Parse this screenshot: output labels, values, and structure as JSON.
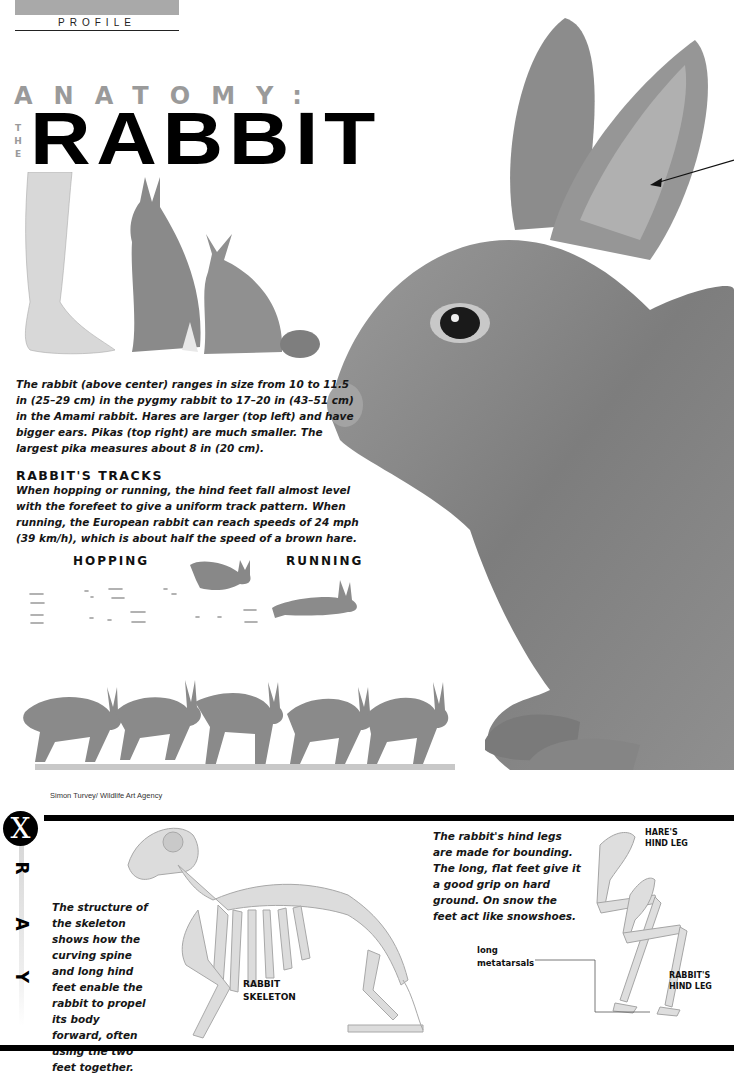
{
  "header": {
    "section_label": "PROFILE"
  },
  "title": {
    "kicker": "ANATOMY:",
    "the_vertical": [
      "T",
      "H",
      "E"
    ],
    "main": "RABBIT"
  },
  "size_caption": "The rabbit (above center) ranges in size from 10 to 11.5 in (25–29 cm) in the pygmy rabbit to 17–20 in (43–51 cm) in the Amami rabbit. Hares are larger (top left) and have bigger ears. Pikas (top right) are much smaller. The largest pika measures about 8 in (20 cm).",
  "tracks": {
    "heading": "RABBIT'S TRACKS",
    "body": "When hopping or running, the hind feet fall almost level with the forefeet to give a uniform track pattern. When running, the European rabbit can reach speeds of 24 mph (39 km/h), which is about half the speed of a brown hare.",
    "hopping_label": "HOPPING",
    "running_label": "RUNNING"
  },
  "credit": "Simon Turvey/ Wildlife Art Agency",
  "xray": {
    "badge": "X",
    "letters": [
      "R",
      "A",
      "Y"
    ],
    "skeleton_text": "The structure of the skeleton shows how the curving spine and long hind feet enable the rabbit to propel its body forward, often using the two feet together.",
    "skeleton_label_line1": "RABBIT",
    "skeleton_label_line2": "SKELETON",
    "hind_legs_text": "The rabbit's hind legs are made for bounding. The long, flat feet give it a good grip on hard ground. On snow the feet act like snowshoes.",
    "hare_label_line1": "HARE'S",
    "hare_label_line2": "HIND LEG",
    "rabbit_leg_label_line1": "RABBIT'S",
    "rabbit_leg_label_line2": "HIND LEG",
    "metatarsals_line1": "long",
    "metatarsals_line2": "metatarsals"
  },
  "colors": {
    "title_gray": "#9a9a9a",
    "profile_bar": "#a9a9a9",
    "rule_black": "#000000",
    "illustration_gray": "#8a8a8a"
  }
}
